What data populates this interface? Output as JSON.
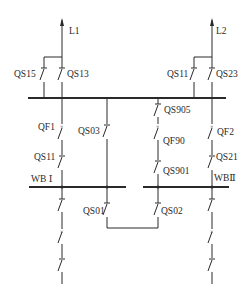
{
  "diagram": {
    "type": "electrical single-line diagram (double bus with bypass)",
    "lines": [
      {
        "id": "L1",
        "label": "L1"
      },
      {
        "id": "L2",
        "label": "L2"
      }
    ],
    "buses": [
      {
        "id": "WB1",
        "label": "WB Ⅰ"
      },
      {
        "id": "WB2",
        "label": "WBⅡ"
      }
    ],
    "switches": {
      "QS15": "QS15",
      "QS13": "QS13",
      "QS11_top": "QS11",
      "QS23": "QS23",
      "QF1": "QF1",
      "QS03": "QS03",
      "QS905": "QS905",
      "QF90": "QF90",
      "QF2": "QF2",
      "QS11_bottom": "QS11",
      "QS901": "QS901",
      "QS21": "QS21",
      "QS01": "QS01",
      "QS02": "QS02"
    },
    "colors": {
      "line": "#2a2a2a",
      "background": "#ffffff"
    }
  }
}
